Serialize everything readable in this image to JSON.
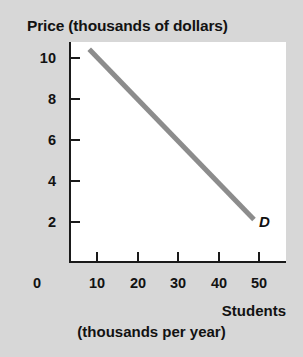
{
  "chart_data": {
    "type": "line",
    "title": "Price (thousands of dollars)",
    "xlabel": "Students",
    "xlabel_sub": "(thousands per year)",
    "ylabel": "Price (thousands of dollars)",
    "xlim": [
      0,
      54
    ],
    "ylim": [
      0,
      11
    ],
    "grid": false,
    "legend": "none",
    "x_ticks": [
      {
        "value": 0,
        "label": "0"
      },
      {
        "value": 10,
        "label": "10"
      },
      {
        "value": 20,
        "label": "20"
      },
      {
        "value": 30,
        "label": "30"
      },
      {
        "value": 40,
        "label": "40"
      },
      {
        "value": 50,
        "label": "50"
      }
    ],
    "y_ticks": [
      {
        "value": 10,
        "label": "10"
      },
      {
        "value": 8,
        "label": "8"
      },
      {
        "value": 6,
        "label": "6"
      },
      {
        "value": 4,
        "label": "4"
      },
      {
        "value": 2,
        "label": "2"
      }
    ],
    "series": [
      {
        "name": "D",
        "annotation": "D",
        "color": "#8c8c8c",
        "line_width": 5,
        "x": [
          8.2,
          49.0
        ],
        "values": [
          10.4,
          2.1
        ],
        "points": [
          {
            "x": 8.2,
            "y": 10.4
          },
          {
            "x": 49.0,
            "y": 2.1
          }
        ]
      }
    ],
    "annotations": [
      {
        "text": "D",
        "x": 51.5,
        "y": 1.8,
        "style": "bold-italic"
      }
    ]
  }
}
